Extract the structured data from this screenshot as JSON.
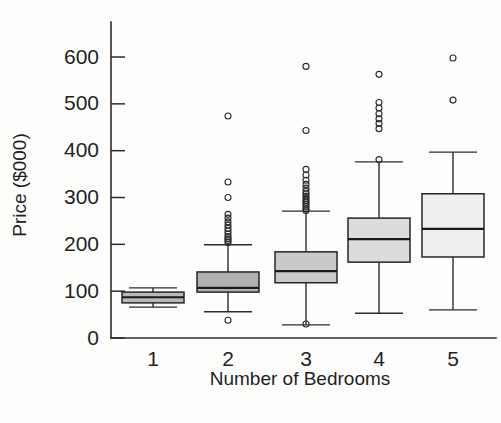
{
  "chart_data": {
    "type": "box",
    "title": "",
    "xlabel": "Number of Bedrooms",
    "ylabel": "Price ($000)",
    "categories": [
      "1",
      "2",
      "3",
      "4",
      "5"
    ],
    "xtick_labels": [
      "1",
      "2",
      "3",
      "4",
      "5"
    ],
    "ytick_labels": [
      "0",
      "100",
      "200",
      "300",
      "400",
      "500",
      "600"
    ],
    "yticks": [
      0,
      100,
      200,
      300,
      400,
      500,
      600
    ],
    "ylim": [
      0,
      620
    ],
    "grid": false,
    "legend": false,
    "box_fill_colors": [
      "#b9b9b9",
      "#b0b0b0",
      "#c9c9c9",
      "#dcdcdc",
      "#efefef"
    ],
    "line_color": "#262626",
    "boxes": [
      {
        "category": "1",
        "whisker_low": 66,
        "q1": 75,
        "median": 87,
        "q3": 98,
        "whisker_high": 107,
        "outliers": []
      },
      {
        "category": "2",
        "whisker_low": 56,
        "q1": 98,
        "median": 107,
        "q3": 141,
        "whisker_high": 199,
        "outliers": [
          38,
          204,
          208,
          212,
          216,
          222,
          228,
          234,
          241,
          248,
          256,
          264,
          300,
          333,
          474
        ]
      },
      {
        "category": "3",
        "whisker_low": 28,
        "q1": 118,
        "median": 143,
        "q3": 184,
        "whisker_high": 271,
        "outliers": [
          30,
          272,
          276,
          281,
          286,
          290,
          294,
          298,
          303,
          308,
          313,
          320,
          328,
          337,
          348,
          360,
          443,
          580
        ]
      },
      {
        "category": "4",
        "whisker_low": 53,
        "q1": 162,
        "median": 211,
        "q3": 256,
        "whisker_high": 376,
        "outliers": [
          381,
          447,
          458,
          468,
          479,
          491,
          503,
          563
        ]
      },
      {
        "category": "5",
        "whisker_low": 60,
        "q1": 173,
        "median": 233,
        "q3": 308,
        "whisker_high": 397,
        "outliers": [
          508,
          598
        ]
      }
    ]
  },
  "axes": {
    "y_title": "Price ($000)",
    "x_title": "Number of Bedrooms"
  }
}
